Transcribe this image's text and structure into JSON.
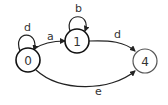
{
  "diagram": {
    "type": "state-machine",
    "nodes": [
      {
        "id": "0",
        "label": "0",
        "cx": 28,
        "cy": 60,
        "r": 12,
        "stroke": "#111111",
        "stroke_width": 1.6
      },
      {
        "id": "1",
        "label": "1",
        "cx": 77,
        "cy": 41,
        "r": 12,
        "stroke": "#111111",
        "stroke_width": 1.6
      },
      {
        "id": "4",
        "label": "4",
        "cx": 145,
        "cy": 61,
        "r": 12,
        "stroke": "#555555",
        "stroke_width": 1.2
      }
    ],
    "edges": [
      {
        "from": "0",
        "to": "0",
        "label": "d",
        "kind": "self-loop"
      },
      {
        "from": "0",
        "to": "1",
        "label": "a",
        "kind": "arc"
      },
      {
        "from": "1",
        "to": "1",
        "label": "b",
        "kind": "self-loop"
      },
      {
        "from": "1",
        "to": "4",
        "label": "d",
        "kind": "arc"
      },
      {
        "from": "0",
        "to": "4",
        "label": "e",
        "kind": "arc"
      }
    ],
    "colors": {
      "edge": "#222222",
      "text": "#333333",
      "background": "#ffffff"
    }
  }
}
